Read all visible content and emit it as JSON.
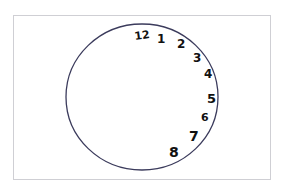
{
  "diagram": {
    "type": "clock-drawing",
    "circle_stroke_color": "#3b3b5c",
    "numbers": [
      {
        "label": "12"
      },
      {
        "label": "1"
      },
      {
        "label": "2"
      },
      {
        "label": "3"
      },
      {
        "label": "4"
      },
      {
        "label": "5"
      },
      {
        "label": "6"
      },
      {
        "label": "7"
      },
      {
        "label": "8"
      }
    ]
  }
}
